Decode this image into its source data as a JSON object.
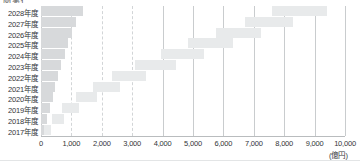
{
  "title_fragment": "図表1",
  "axis": {
    "unit_label": "(億円)",
    "xticks": [
      {
        "value": 0,
        "label": "0"
      },
      {
        "value": 1000,
        "label": "1,000"
      },
      {
        "value": 2000,
        "label": "2,000"
      },
      {
        "value": 3000,
        "label": "3,000"
      },
      {
        "value": 4000,
        "label": "4,000"
      },
      {
        "value": 5000,
        "label": "5,000"
      },
      {
        "value": 6000,
        "label": "6,000"
      },
      {
        "value": 7000,
        "label": "7,000"
      },
      {
        "value": 8000,
        "label": "8,000"
      },
      {
        "value": 9000,
        "label": "9,000"
      },
      {
        "value": 10000,
        "label": "10,000"
      }
    ]
  },
  "colors": {
    "bar_left": "#d7d9db",
    "bar_float": "#e8eaeb",
    "gridline": "#c9ccce",
    "gridline_dashed": "#d2d5d7",
    "text": "#333538",
    "background": "#ffffff"
  },
  "chart_data": {
    "type": "bar",
    "orientation": "horizontal",
    "title": "図表1",
    "xlabel": "(億円)",
    "ylabel": "",
    "xlim": [
      0,
      10000
    ],
    "grid": true,
    "legend": "none",
    "categories": [
      "2028年度",
      "2027年度",
      "2026年度",
      "2025年度",
      "2024年度",
      "2023年度",
      "2022年度",
      "2021年度",
      "2020年度",
      "2019年度",
      "2018年度",
      "2017年度"
    ],
    "series": [
      {
        "name": "左側バー（0起点）",
        "type": "bar",
        "values": [
          1380,
          1160,
          1030,
          900,
          800,
          660,
          560,
          470,
          400,
          300,
          210,
          110
        ]
      },
      {
        "name": "右側フロートバー（累積帯）",
        "type": "floating-bar",
        "ranges": [
          [
            7600,
            9400
          ],
          [
            6700,
            8300
          ],
          [
            5750,
            7250
          ],
          [
            4850,
            6300
          ],
          [
            3950,
            5350
          ],
          [
            3100,
            4450
          ],
          [
            2350,
            3450
          ],
          [
            1700,
            2600
          ],
          [
            1150,
            1850
          ],
          [
            700,
            1250
          ],
          [
            350,
            750
          ],
          [
            100,
            330
          ]
        ]
      }
    ]
  }
}
